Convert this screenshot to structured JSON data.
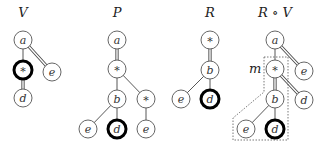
{
  "diagram": {
    "trees": [
      {
        "title": "V",
        "nodes": [
          {
            "id": "a",
            "label": "a",
            "x": 23,
            "y": 40,
            "bold": false
          },
          {
            "id": "s",
            "label": "*",
            "x": 23,
            "y": 70,
            "bold": true
          },
          {
            "id": "e",
            "label": "e",
            "x": 52,
            "y": 72,
            "bold": false
          },
          {
            "id": "d",
            "label": "d",
            "x": 23,
            "y": 98,
            "bold": false
          }
        ],
        "edges": [
          {
            "from": "a",
            "to": "s",
            "double": false
          },
          {
            "from": "a",
            "to": "e",
            "double": true
          },
          {
            "from": "s",
            "to": "d",
            "double": true
          }
        ]
      },
      {
        "title": "P",
        "nodes": [
          {
            "id": "a",
            "label": "a",
            "x": 117,
            "y": 40,
            "bold": false
          },
          {
            "id": "s1",
            "label": "*",
            "x": 117,
            "y": 69,
            "bold": false
          },
          {
            "id": "b",
            "label": "b",
            "x": 117,
            "y": 99,
            "bold": false
          },
          {
            "id": "s2",
            "label": "*",
            "x": 146,
            "y": 99,
            "bold": false
          },
          {
            "id": "e1",
            "label": "e",
            "x": 88,
            "y": 129,
            "bold": false
          },
          {
            "id": "d",
            "label": "d",
            "x": 117,
            "y": 129,
            "bold": true
          },
          {
            "id": "e2",
            "label": "e",
            "x": 146,
            "y": 129,
            "bold": false
          }
        ],
        "edges": [
          {
            "from": "a",
            "to": "s1",
            "double": true
          },
          {
            "from": "s1",
            "to": "b",
            "double": false
          },
          {
            "from": "s1",
            "to": "s2",
            "double": false
          },
          {
            "from": "b",
            "to": "e1",
            "double": false
          },
          {
            "from": "b",
            "to": "d",
            "double": false
          },
          {
            "from": "s2",
            "to": "e2",
            "double": false
          }
        ]
      },
      {
        "title": "R",
        "nodes": [
          {
            "id": "s",
            "label": "*",
            "x": 210,
            "y": 40,
            "bold": false
          },
          {
            "id": "b",
            "label": "b",
            "x": 210,
            "y": 70,
            "bold": false
          },
          {
            "id": "e",
            "label": "e",
            "x": 181,
            "y": 99,
            "bold": false
          },
          {
            "id": "d",
            "label": "d",
            "x": 210,
            "y": 99,
            "bold": true
          }
        ],
        "edges": [
          {
            "from": "s",
            "to": "b",
            "double": true
          },
          {
            "from": "b",
            "to": "e",
            "double": false
          },
          {
            "from": "b",
            "to": "d",
            "double": false
          }
        ]
      },
      {
        "title": "R ∘ V",
        "nodes": [
          {
            "id": "a",
            "label": "a",
            "x": 275,
            "y": 40,
            "bold": false
          },
          {
            "id": "s",
            "label": "*",
            "x": 275,
            "y": 69,
            "bold": false
          },
          {
            "id": "e1",
            "label": "e",
            "x": 304,
            "y": 71,
            "bold": false
          },
          {
            "id": "b",
            "label": "b",
            "x": 275,
            "y": 99,
            "bold": false
          },
          {
            "id": "d1",
            "label": "d",
            "x": 304,
            "y": 100,
            "bold": false
          },
          {
            "id": "e2",
            "label": "e",
            "x": 246,
            "y": 129,
            "bold": false
          },
          {
            "id": "d2",
            "label": "d",
            "x": 275,
            "y": 129,
            "bold": true
          }
        ],
        "edges": [
          {
            "from": "a",
            "to": "s",
            "double": false
          },
          {
            "from": "a",
            "to": "e1",
            "double": true
          },
          {
            "from": "s",
            "to": "b",
            "double": true
          },
          {
            "from": "s",
            "to": "d1",
            "double": true
          },
          {
            "from": "b",
            "to": "e2",
            "double": false
          },
          {
            "from": "b",
            "to": "d2",
            "double": false
          }
        ],
        "region_label": "m"
      }
    ]
  }
}
